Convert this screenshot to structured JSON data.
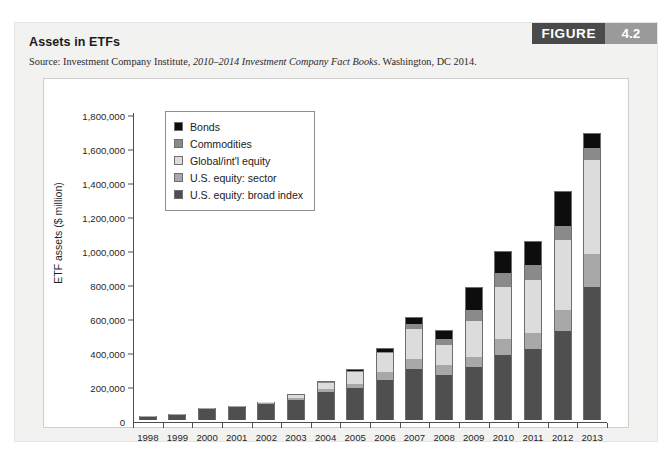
{
  "figure": {
    "badge_word": "FIGURE",
    "badge_number": "4.2",
    "title": "Assets in ETFs",
    "source_prefix": "Source: Investment Company Institute, ",
    "source_italic": "2010–2014 Investment Company Fact Books",
    "source_suffix": ". Washington, DC 2014."
  },
  "colors": {
    "bonds": "#0d0d0d",
    "commodities": "#8a8a8a",
    "global_intl_equity": "#dcdcdc",
    "us_equity_sector": "#a8a8a8",
    "us_equity_broad_index": "#4f4f4f",
    "panel_bg": "#ffffff",
    "card_bg": "#f2f2f1",
    "axis": "#4d4d4d",
    "badge_dark": "#4a4a4a",
    "badge_light": "#9a9a9a"
  },
  "chart_data": {
    "type": "bar",
    "stacked": true,
    "title": "Assets in ETFs",
    "xlabel": "",
    "ylabel": "ETF assets ($ million)",
    "ylim": [
      0,
      1800000
    ],
    "ytick_step": 200000,
    "grid": false,
    "legend_position": "upper-left-inside",
    "ytick_labels": [
      "0",
      "200,000",
      "400,000",
      "600,000",
      "800,000",
      "1,000,000",
      "1,200,000",
      "1,400,000",
      "1,600,000",
      "1,800,000"
    ],
    "ytick_values": [
      0,
      200000,
      400000,
      600000,
      800000,
      1000000,
      1200000,
      1400000,
      1600000,
      1800000
    ],
    "categories": [
      "1998",
      "1999",
      "2000",
      "2001",
      "2002",
      "2003",
      "2004",
      "2005",
      "2006",
      "2007",
      "2008",
      "2009",
      "2010",
      "2011",
      "2012",
      "2013"
    ],
    "series": [
      {
        "name": "U.S. equity: broad index",
        "color": "#4f4f4f",
        "values": [
          15000,
          31000,
          62000,
          79000,
          93000,
          120000,
          163000,
          186000,
          236000,
          300000,
          266000,
          311000,
          385000,
          415000,
          525000,
          785000
        ]
      },
      {
        "name": "U.S. equity: sector",
        "color": "#a8a8a8",
        "values": [
          1000,
          2000,
          4000,
          5000,
          6000,
          10000,
          20000,
          28000,
          44000,
          57000,
          59000,
          61000,
          91000,
          98000,
          125000,
          190000
        ]
      },
      {
        "name": "Global/int'l equity",
        "color": "#dcdcdc",
        "values": [
          0,
          0,
          0,
          0,
          6000,
          15000,
          34000,
          66000,
          112000,
          179000,
          114000,
          210000,
          305000,
          313000,
          410000,
          555000
        ]
      },
      {
        "name": "Commodities",
        "color": "#8a8a8a",
        "values": [
          0,
          0,
          0,
          0,
          0,
          0,
          2000,
          5000,
          11000,
          29000,
          36000,
          68000,
          85000,
          88000,
          80000,
          70000
        ]
      },
      {
        "name": "Bonds",
        "color": "#0d0d0d",
        "values": [
          0,
          0,
          0,
          0,
          0,
          3000,
          7000,
          16000,
          21000,
          40000,
          57000,
          133000,
          131000,
          139000,
          205000,
          90000
        ]
      }
    ],
    "totals": [
      16000,
      33000,
      66000,
      84000,
      105000,
      148000,
      226000,
      301000,
      424000,
      605000,
      532000,
      783000,
      997000,
      1053000,
      1345000,
      1690000
    ]
  },
  "legend": {
    "items": [
      {
        "label": "Bonds",
        "color": "#0d0d0d"
      },
      {
        "label": "Commodities",
        "color": "#8a8a8a"
      },
      {
        "label": "Global/int'l equity",
        "color": "#dcdcdc"
      },
      {
        "label": "U.S. equity: sector",
        "color": "#a8a8a8"
      },
      {
        "label": "U.S. equity: broad index",
        "color": "#4f4f4f"
      }
    ]
  }
}
